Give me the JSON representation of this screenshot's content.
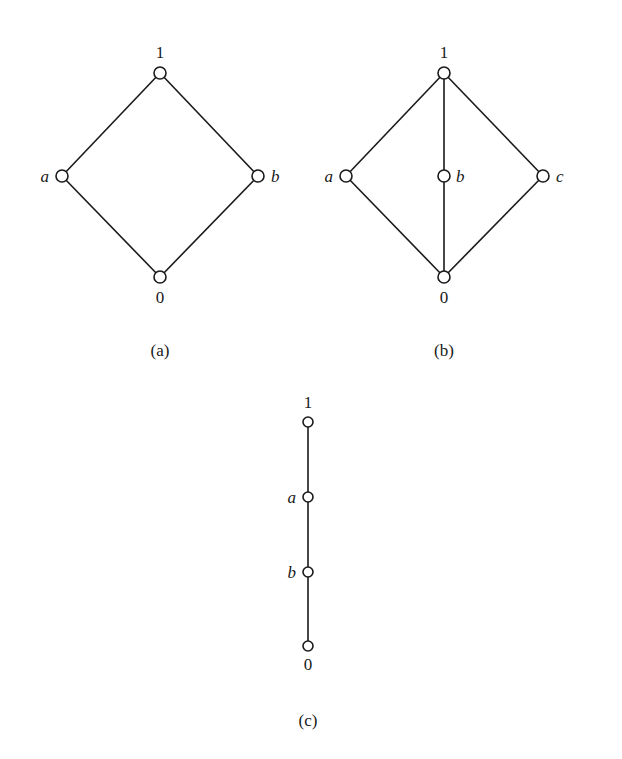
{
  "figure": {
    "diagrams": [
      {
        "id": "a",
        "caption": "(a)",
        "nodes": [
          {
            "id": "1",
            "label": "1",
            "x": 160,
            "y": 73,
            "label_pos": "above"
          },
          {
            "id": "a",
            "label": "a",
            "x": 62,
            "y": 176,
            "label_pos": "left"
          },
          {
            "id": "b",
            "label": "b",
            "x": 258,
            "y": 176,
            "label_pos": "right"
          },
          {
            "id": "0",
            "label": "0",
            "x": 160,
            "y": 277,
            "label_pos": "below"
          }
        ],
        "edges": [
          [
            "1",
            "a"
          ],
          [
            "1",
            "b"
          ],
          [
            "a",
            "0"
          ],
          [
            "b",
            "0"
          ]
        ]
      },
      {
        "id": "b",
        "caption": "(b)",
        "nodes": [
          {
            "id": "1",
            "label": "1",
            "x": 444,
            "y": 73,
            "label_pos": "above"
          },
          {
            "id": "a",
            "label": "a",
            "x": 346,
            "y": 176,
            "label_pos": "left"
          },
          {
            "id": "b",
            "label": "b",
            "x": 444,
            "y": 176,
            "label_pos": "right"
          },
          {
            "id": "c",
            "label": "c",
            "x": 543,
            "y": 176,
            "label_pos": "right"
          },
          {
            "id": "0",
            "label": "0",
            "x": 444,
            "y": 277,
            "label_pos": "below"
          }
        ],
        "edges": [
          [
            "1",
            "a"
          ],
          [
            "1",
            "b"
          ],
          [
            "1",
            "c"
          ],
          [
            "a",
            "0"
          ],
          [
            "b",
            "0"
          ],
          [
            "c",
            "0"
          ]
        ]
      },
      {
        "id": "c",
        "caption": "(c)",
        "nodes": [
          {
            "id": "1",
            "label": "1",
            "x": 308,
            "y": 422,
            "label_pos": "above"
          },
          {
            "id": "a",
            "label": "a",
            "x": 308,
            "y": 497,
            "label_pos": "left"
          },
          {
            "id": "b",
            "label": "b",
            "x": 308,
            "y": 572,
            "label_pos": "left"
          },
          {
            "id": "0",
            "label": "0",
            "x": 308,
            "y": 646,
            "label_pos": "below"
          }
        ],
        "edges": [
          [
            "1",
            "a"
          ],
          [
            "a",
            "b"
          ],
          [
            "b",
            "0"
          ]
        ]
      }
    ],
    "captions": {
      "a": "(a)",
      "b": "(b)",
      "c": "(c)"
    },
    "labels": {
      "a_top": "1",
      "a_left": "a",
      "a_right": "b",
      "a_bottom": "0",
      "b_top": "1",
      "b_left": "a",
      "b_mid": "b",
      "b_right": "c",
      "b_bottom": "0",
      "c_top": "1",
      "c_a": "a",
      "c_b": "b",
      "c_bottom": "0"
    }
  }
}
